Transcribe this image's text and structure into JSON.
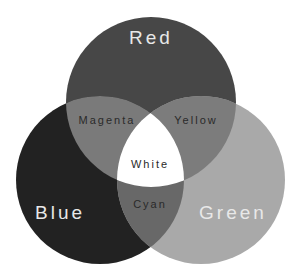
{
  "diagram": {
    "type": "venn",
    "circles": [
      {
        "id": "red",
        "label": "Red",
        "cx": 151,
        "cy": 102,
        "r": 85,
        "fill": "#474747"
      },
      {
        "id": "blue",
        "label": "Blue",
        "cx": 100,
        "cy": 180,
        "r": 84,
        "fill": "#222222"
      },
      {
        "id": "green",
        "label": "Green",
        "cx": 201,
        "cy": 180,
        "r": 84,
        "fill": "#a9a9a9"
      }
    ],
    "overlaps": {
      "magenta": {
        "label": "Magenta",
        "sets": [
          "red",
          "blue"
        ],
        "fill": "#7a7a7a"
      },
      "yellow": {
        "label": "Yellow",
        "sets": [
          "red",
          "green"
        ],
        "fill": "#7c7c7c"
      },
      "cyan": {
        "label": "Cyan",
        "sets": [
          "blue",
          "green"
        ],
        "fill": "#686868"
      },
      "white": {
        "label": "White",
        "sets": [
          "red",
          "blue",
          "green"
        ],
        "fill": "#ffffff"
      }
    }
  }
}
